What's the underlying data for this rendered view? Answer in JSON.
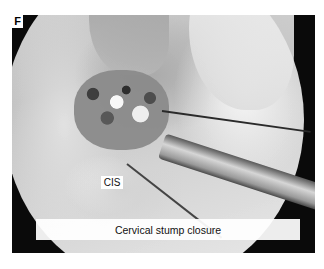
{
  "figure": {
    "panel_letter": "F",
    "image_description": "Grayscale laparoscopic surgical view",
    "labels": {
      "cis": "CIS"
    },
    "caption": "Cervical stump closure"
  }
}
